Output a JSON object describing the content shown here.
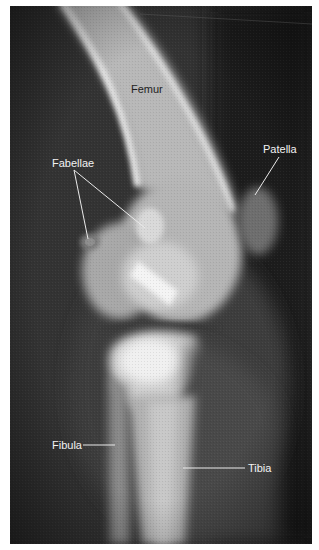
{
  "figure": {
    "type": "lateral knee radiograph",
    "labels": {
      "femur": "Femur",
      "fabellae": "Fabellae",
      "patella": "Patella",
      "fibula": "Fibula",
      "tibia": "Tibia"
    },
    "colors": {
      "background": "#2a2a2a",
      "bone": "#d8d8d8",
      "label_light": "#f2f2f2",
      "label_dark": "#1e1e1e"
    }
  }
}
